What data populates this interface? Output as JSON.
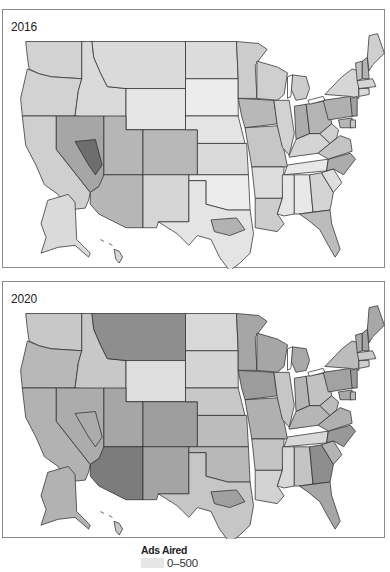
{
  "panels": [
    {
      "title": "2016",
      "shades": {
        "WA": "#d2d2d2",
        "OR": "#d2d2d2",
        "CA": "#cfcfcf",
        "ID": "#dadada",
        "NV": "#a6a6a6",
        "NV_hot": "#6e6e6e",
        "MT": "#dadada",
        "WY": "#e6e6e6",
        "UT": "#b6b6b6",
        "CO": "#b8b8b8",
        "AZ": "#b6b6b6",
        "NM": "#d6d6d6",
        "ND": "#dcdcdc",
        "SD": "#ececec",
        "NE": "#e4e4e4",
        "KS": "#dadada",
        "OK": "#ececec",
        "TX": "#e4e4e4",
        "TX_hot": "#b2b2b2",
        "MN": "#cdcdcd",
        "IA": "#b8b8b8",
        "MO": "#c6c6c6",
        "AR": "#dddddd",
        "LA": "#cdcdcd",
        "WI": "#cfcfcf",
        "IL": "#d2d2d2",
        "MI": "#cdcdcd",
        "IN": "#acacac",
        "OH": "#b4b4b4",
        "KY": "#d4d4d4",
        "TN": "#e8e8e8",
        "MS": "#e6e6e6",
        "AL": "#e8e8e8",
        "GA": "#d4d4d4",
        "FL": "#bcbcbc",
        "SC": "#dedede",
        "NC": "#acacac",
        "VA": "#c4c4c4",
        "WV": "#cfcfcf",
        "PA": "#b0b0b0",
        "NY": "#d6d6d6",
        "VT": "#c2c2c2",
        "NH": "#b4b4b4",
        "ME": "#cfcfcf",
        "MA": "#d6d6d6",
        "CT": "#dadada",
        "NJ": "#a0a0a0",
        "MD": "#b6b6b6",
        "DE": "#c8c8c8",
        "AK": "#dadada",
        "HI": "#d6d6d6"
      }
    },
    {
      "title": "2020",
      "shades": {
        "WA": "#c8c8c8",
        "OR": "#b8b8b8",
        "CA": "#b2b2b2",
        "ID": "#c8c8c8",
        "NV": "#acacac",
        "NV_hot": "#acacac",
        "MT": "#8e8e8e",
        "WY": "#dedede",
        "UT": "#a6a6a6",
        "CO": "#9e9e9e",
        "AZ": "#7c7c7c",
        "NM": "#a4a4a4",
        "ND": "#d8d8d8",
        "SD": "#d4d4d4",
        "NE": "#c8c8c8",
        "KS": "#bcbcbc",
        "OK": "#b8b8b8",
        "TX": "#c6c6c6",
        "TX_hot": "#a0a0a0",
        "MN": "#a6a6a6",
        "IA": "#9c9c9c",
        "MO": "#b0b0b0",
        "AR": "#c4c4c4",
        "LA": "#d2d2d2",
        "WI": "#a6a6a6",
        "IL": "#c6c6c6",
        "MI": "#a8a8a8",
        "IN": "#b4b4b4",
        "OH": "#c2c2c2",
        "KY": "#b6b6b6",
        "TN": "#d8d8d8",
        "MS": "#d8d8d8",
        "AL": "#c4c4c4",
        "GA": "#8e8e8e",
        "FL": "#a6a6a6",
        "SC": "#b4b4b4",
        "NC": "#989898",
        "VA": "#b0b0b0",
        "WV": "#bcbcbc",
        "PA": "#a2a2a2",
        "NY": "#bcbcbc",
        "VT": "#aaaaaa",
        "NH": "#a4a4a4",
        "ME": "#a8a8a8",
        "MA": "#cacaca",
        "CT": "#cfcfcf",
        "NJ": "#9a9a9a",
        "MD": "#a8a8a8",
        "DE": "#b8b8b8",
        "AK": "#b2b2b2",
        "HI": "#c8c8c8"
      }
    }
  ],
  "legend": {
    "title": "Ads Aired",
    "items": [
      {
        "label": "0–500",
        "color": "#e6e6e6"
      }
    ]
  }
}
